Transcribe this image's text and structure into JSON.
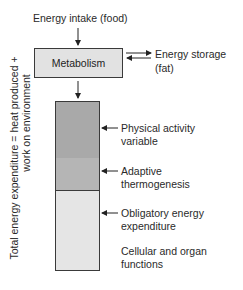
{
  "diagram": {
    "input_label": "Energy intake (food)",
    "process_box": "Metabolism",
    "storage_label_line1": "Energy storage",
    "storage_label_line2": "(fat)",
    "side_label_line1": "Total energy expenditure = heat produced +",
    "side_label_line2": "work on environment",
    "segments": [
      {
        "label_line1": "Physical activity",
        "label_line2": "variable",
        "color": "#a9a9a9"
      },
      {
        "label_line1": "Adaptive",
        "label_line2": "thermogenesis",
        "color": "#b5b5b5"
      },
      {
        "label_line1": "Obligatory energy",
        "label_line2": "expenditure",
        "color": "#e5e5e5"
      }
    ],
    "bottom_note_line1": "Cellular and organ",
    "bottom_note_line2": "functions",
    "colors": {
      "metabolism_box": "#e2e2e2",
      "stroke": "#3a3a3a"
    }
  }
}
